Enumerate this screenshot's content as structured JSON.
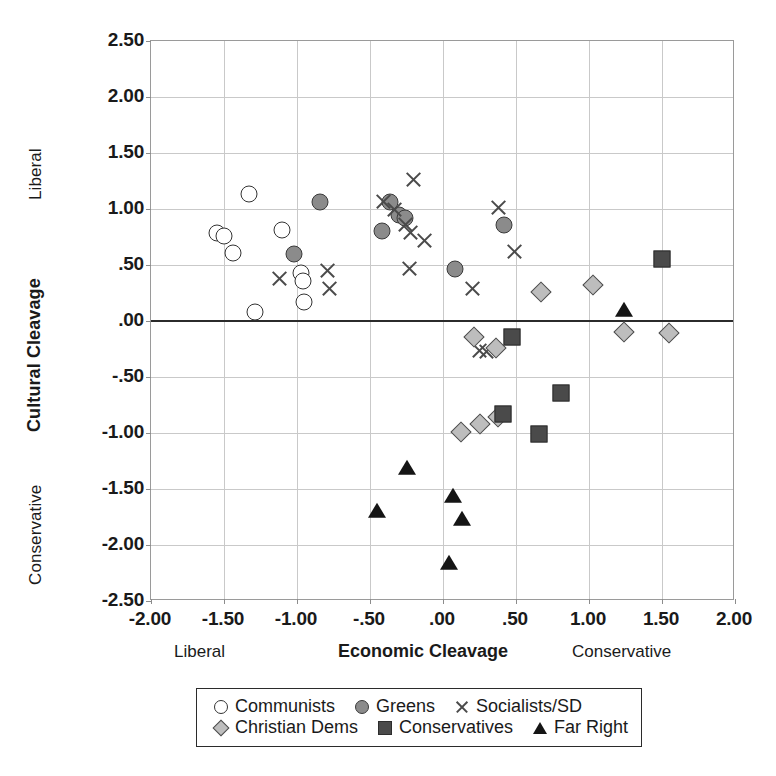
{
  "chart_data": {
    "type": "scatter",
    "title": "",
    "xlabel": "Economic Cleavage",
    "ylabel": "Cultural Cleavage",
    "xlim": [
      -2.0,
      2.0
    ],
    "ylim": [
      -2.5,
      2.5
    ],
    "grid": true,
    "zero_line_y": 0.0,
    "legend_position": "below-axis",
    "x_axis_end_labels": {
      "left": "Liberal",
      "right": "Conservative"
    },
    "y_axis_end_labels": {
      "top": "Liberal",
      "bottom": "Conservative"
    },
    "xticks": [
      "-2.00",
      "-1.50",
      "-1.00",
      "-.50",
      ".00",
      ".50",
      "1.00",
      "1.50",
      "2.00"
    ],
    "xtick_values": [
      -2.0,
      -1.5,
      -1.0,
      -0.5,
      0.0,
      0.5,
      1.0,
      1.5,
      2.0
    ],
    "yticks": [
      "2.50",
      "2.00",
      "1.50",
      "1.00",
      ".50",
      ".00",
      "-.50",
      "-1.00",
      "-1.50",
      "-2.00",
      "-2.50"
    ],
    "ytick_values": [
      2.5,
      2.0,
      1.5,
      1.0,
      0.5,
      0.0,
      -0.5,
      -1.0,
      -1.5,
      -2.0,
      -2.5
    ],
    "series": [
      {
        "name": "Communists",
        "marker": "circle-open",
        "color": "#ffffff",
        "points": [
          [
            -1.33,
            1.13
          ],
          [
            -1.55,
            0.79
          ],
          [
            -1.5,
            0.76
          ],
          [
            -1.44,
            0.61
          ],
          [
            -1.1,
            0.81
          ],
          [
            -0.97,
            0.43
          ],
          [
            -0.96,
            0.36
          ],
          [
            -0.95,
            0.17
          ],
          [
            -1.29,
            0.08
          ]
        ]
      },
      {
        "name": "Greens",
        "marker": "circle-filled",
        "color": "#8b8b8b",
        "points": [
          [
            -0.84,
            1.06
          ],
          [
            -1.02,
            0.6
          ],
          [
            -0.42,
            0.8
          ],
          [
            -0.36,
            1.06
          ],
          [
            -0.3,
            0.95
          ],
          [
            -0.26,
            0.92
          ],
          [
            0.08,
            0.46
          ],
          [
            0.42,
            0.86
          ]
        ]
      },
      {
        "name": "Socialists/SD",
        "marker": "cross",
        "color": "#4a4a4a",
        "points": [
          [
            -1.12,
            0.38
          ],
          [
            -0.79,
            0.45
          ],
          [
            -0.78,
            0.29
          ],
          [
            -0.41,
            1.07
          ],
          [
            -0.33,
            1.0
          ],
          [
            -0.26,
            0.86
          ],
          [
            -0.22,
            0.79
          ],
          [
            -0.2,
            1.26
          ],
          [
            -0.13,
            0.72
          ],
          [
            -0.23,
            0.47
          ],
          [
            0.38,
            1.01
          ],
          [
            0.2,
            0.29
          ],
          [
            0.49,
            0.62
          ],
          [
            0.25,
            -0.26
          ],
          [
            0.3,
            -0.27
          ]
        ]
      },
      {
        "name": "Christian Dems",
        "marker": "diamond",
        "color": "#bdbdbd",
        "points": [
          [
            0.21,
            -0.14
          ],
          [
            0.36,
            -0.24
          ],
          [
            0.38,
            -0.86
          ],
          [
            0.25,
            -0.92
          ],
          [
            0.67,
            0.26
          ],
          [
            1.03,
            0.32
          ],
          [
            1.24,
            -0.1
          ],
          [
            1.55,
            -0.11
          ]
        ]
      },
      {
        "name": "Conservatives",
        "marker": "square",
        "color": "#4a4a4a",
        "points": [
          [
            0.47,
            -0.14
          ],
          [
            0.41,
            -0.83
          ],
          [
            0.81,
            -0.64
          ],
          [
            0.66,
            -1.01
          ],
          [
            1.5,
            0.55
          ]
        ]
      },
      {
        "name": "Far Right",
        "marker": "triangle",
        "color": "#151515",
        "points": [
          [
            1.24,
            0.1
          ],
          [
            -0.25,
            -1.31
          ],
          [
            -0.45,
            -1.7
          ],
          [
            0.07,
            -1.56
          ],
          [
            0.13,
            -1.77
          ],
          [
            0.04,
            -2.16
          ]
        ]
      }
    ],
    "extra_markers": [
      {
        "series": "Christian Dems",
        "marker": "diamond",
        "x": 0.12,
        "y": -0.99,
        "note": "circle-open at -0.99"
      }
    ]
  },
  "legend": {
    "rows": [
      [
        {
          "symbol": "circle-open",
          "label": "Communists"
        },
        {
          "symbol": "circle-filled",
          "label": "Greens"
        },
        {
          "symbol": "cross",
          "label": "Socialists/SD"
        }
      ],
      [
        {
          "symbol": "diamond",
          "label": "Christian Dems"
        },
        {
          "symbol": "square",
          "label": "Conservatives"
        },
        {
          "symbol": "triangle",
          "label": "Far Right"
        }
      ]
    ]
  },
  "colors": {
    "grid": "#c9c9c9",
    "axis": "#2b2b2b",
    "frame": "#9a9a9a",
    "background": "#ffffff"
  }
}
